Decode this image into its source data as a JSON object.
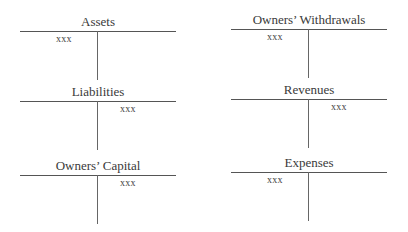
{
  "accounts": [
    {
      "id": "assets",
      "title": "Assets",
      "entry": "xxx",
      "side": "debit"
    },
    {
      "id": "liabilities",
      "title": "Liabilities",
      "entry": "xxx",
      "side": "credit"
    },
    {
      "id": "owners-capital",
      "title": "Owners’ Capital",
      "entry": "xxx",
      "side": "credit"
    },
    {
      "id": "owners-withdrawals",
      "title": "Owners’ Withdrawals",
      "entry": "xxx",
      "side": "debit"
    },
    {
      "id": "revenues",
      "title": "Revenues",
      "entry": "xxx",
      "side": "credit"
    },
    {
      "id": "expenses",
      "title": "Expenses",
      "entry": "xxx",
      "side": "debit"
    }
  ]
}
